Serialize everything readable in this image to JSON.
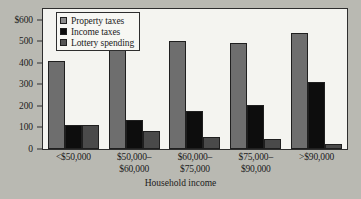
{
  "chart_data": {
    "type": "bar",
    "title": "",
    "subtitle": "",
    "xlabel": "Household income",
    "ylabel": "",
    "ylim": [
      0,
      650
    ],
    "grid": false,
    "legend_position": "top-left",
    "y_ticks": [
      {
        "value": 600,
        "label": "$600"
      },
      {
        "value": 500,
        "label": "500"
      },
      {
        "value": 400,
        "label": "400"
      },
      {
        "value": 300,
        "label": "300"
      },
      {
        "value": 200,
        "label": "200"
      },
      {
        "value": 100,
        "label": "100"
      },
      {
        "value": 0,
        "label": "0"
      }
    ],
    "categories": [
      {
        "line1": "<$50,000",
        "line2": ""
      },
      {
        "line1": "$50,000–",
        "line2": "$60,000"
      },
      {
        "line1": "$60,000–",
        "line2": "$75,000"
      },
      {
        "line1": "$75,000–",
        "line2": "$90,000"
      },
      {
        "line1": ">$90,000",
        "line2": ""
      }
    ],
    "series": [
      {
        "name": "Property taxes",
        "color": "#6e6e6e",
        "legend_color": "#8c8c8c",
        "values": [
          410,
          500,
          500,
          490,
          540
        ]
      },
      {
        "name": "Income taxes",
        "color": "#0d0d0d",
        "legend_color": "#0d0d0d",
        "values": [
          110,
          135,
          175,
          205,
          310
        ]
      },
      {
        "name": "Lottery spending",
        "color": "#4a4a4a",
        "legend_color": "#555555",
        "values": [
          110,
          85,
          58,
          45,
          25
        ]
      }
    ]
  }
}
